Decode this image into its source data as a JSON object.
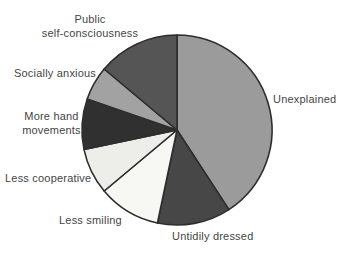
{
  "chart_data": {
    "type": "pie",
    "title": "",
    "legend_position": "none",
    "label_style": "direct labels around pie",
    "start_angle": "12 o'clock",
    "direction": "clockwise",
    "outline_color": "#2e2e2e",
    "background_color": "#ffffff",
    "label_text_color": "#454545",
    "slices": [
      {
        "label": "Unexplained",
        "value_pct": 40.8,
        "angle_deg": 147,
        "color": "#9b9b9b"
      },
      {
        "label": "Untidily dressed",
        "value_pct": 12.5,
        "angle_deg": 45,
        "color": "#474747"
      },
      {
        "label": "Less smiling",
        "value_pct": 10.6,
        "angle_deg": 38,
        "color": "#f7f7f4"
      },
      {
        "label": "Less cooperative",
        "value_pct": 7.8,
        "angle_deg": 28,
        "color": "#ededea"
      },
      {
        "label": "More hand movements",
        "value_pct": 8.6,
        "angle_deg": 31,
        "color": "#303030",
        "label_wrapped": "More hand\nmovements"
      },
      {
        "label": "Socially anxious",
        "value_pct": 5.8,
        "angle_deg": 21,
        "color": "#a2a2a2"
      },
      {
        "label": "Public self-consciousness",
        "value_pct": 13.9,
        "angle_deg": 50,
        "color": "#555555",
        "label_wrapped": "Public\nself-consciousness"
      }
    ]
  }
}
